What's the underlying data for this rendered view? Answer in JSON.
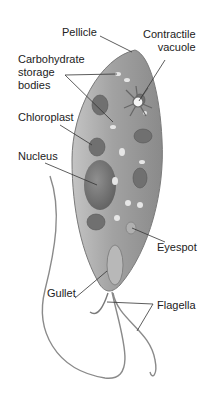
{
  "diagram": {
    "labels": {
      "pellicle": "Pellicle",
      "contractile_vacuole": "Contractile\nvacuole",
      "carbohydrate_storage": "Carbohydrate\nstorage\nbodies",
      "chloroplast": "Chloroplast",
      "nucleus": "Nucleus",
      "eyespot": "Eyespot",
      "gullet": "Gullet",
      "flagella": "Flagella"
    },
    "colors": {
      "body": "#9a9a9a",
      "body_light": "#c8c8c8",
      "organelle_dark": "#6a6a6a",
      "leader_line": "#333333",
      "text": "#222222"
    }
  }
}
